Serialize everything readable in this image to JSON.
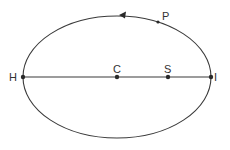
{
  "diagram": {
    "type": "elliptical-orbit",
    "colors": {
      "stroke": "#3a3a3a",
      "background": "#ffffff"
    },
    "ellipse": {
      "cx": 117,
      "cy": 77,
      "rx": 94,
      "ry": 61
    },
    "orbit_direction": "counter-clockwise (arrow on top pointing left)",
    "points": {
      "H": {
        "label": "H",
        "x": 23,
        "y": 77,
        "role": "left vertex of major axis"
      },
      "C": {
        "label": "C",
        "x": 117,
        "y": 77,
        "role": "center"
      },
      "S": {
        "label": "S",
        "x": 168,
        "y": 77,
        "role": "focus"
      },
      "I": {
        "label": "I",
        "x": 211,
        "y": 77,
        "role": "right vertex of major axis"
      },
      "P": {
        "label": "P",
        "x": 158,
        "y": 22,
        "role": "point on orbit"
      }
    }
  }
}
